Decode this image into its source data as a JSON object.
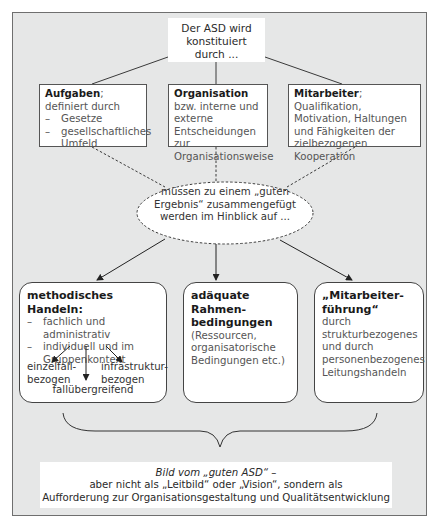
{
  "diagram": {
    "root": {
      "text": "Der ASD wird konstituiert durch ...",
      "lines": [
        "Der ASD wird",
        "konstituiert",
        "durch ..."
      ]
    },
    "factors": [
      {
        "bold": "Aufgaben",
        "rest": "; definiert durch",
        "bullets": [
          "Gesetze",
          "gesellschaftliches Umfeld"
        ]
      },
      {
        "bold": "Organisation",
        "rest": " bzw. interne und externe Entscheidungen zur Organisationsweise"
      },
      {
        "bold": "Mitarbeiter",
        "rest": "; Qualifikation, Motivation, Haltungen und Fähigkeiten der zielbezogenen Kooperation"
      }
    ],
    "connector": {
      "text": "müssen zu einem „guten Ergebnis“ zusammengefügt werden im Hinblick auf ..."
    },
    "outcomes": [
      {
        "title": "methodisches Handeln:",
        "bullets": [
          "fachlich und administrativ",
          "individuell und im Gruppenkontext"
        ],
        "branches": {
          "left": "einzelfall-bezogen",
          "right": "infrastruktur-bezogen",
          "center": "fallübergreifend"
        }
      },
      {
        "title": "adäquate Rahmen-bedingungen",
        "detail": "(Ressourcen, organisatorische Bedingungen etc.)"
      },
      {
        "title": "„Mitarbeiter-führung“",
        "detail": "durch strukturbezogenes und durch personenbezogenes Leitungshandeln"
      }
    ],
    "conclusion": {
      "line1": "Bild vom „guten ASD“ –",
      "line2": "aber nicht als „Leitbild“ oder „Vision“, sondern als",
      "line3": "Aufforderung zur Organisationsgestaltung und Qualitätsentwicklung"
    },
    "colors": {
      "background": "#e6e7e7",
      "box": "#ffffff",
      "line": "#3a3a3a"
    }
  }
}
